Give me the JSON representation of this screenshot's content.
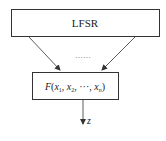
{
  "diagram": {
    "top_box": {
      "label": "LFSR"
    },
    "ellipsis": "……",
    "function_box": {
      "func_name": "F",
      "args": [
        "x",
        "x",
        "x"
      ],
      "subscripts": [
        "1",
        "2",
        "n"
      ],
      "dots": "···"
    },
    "output": {
      "label": "z"
    },
    "colors": {
      "stroke": "#333333",
      "fill": "#ffffff",
      "text": "#222222"
    }
  }
}
